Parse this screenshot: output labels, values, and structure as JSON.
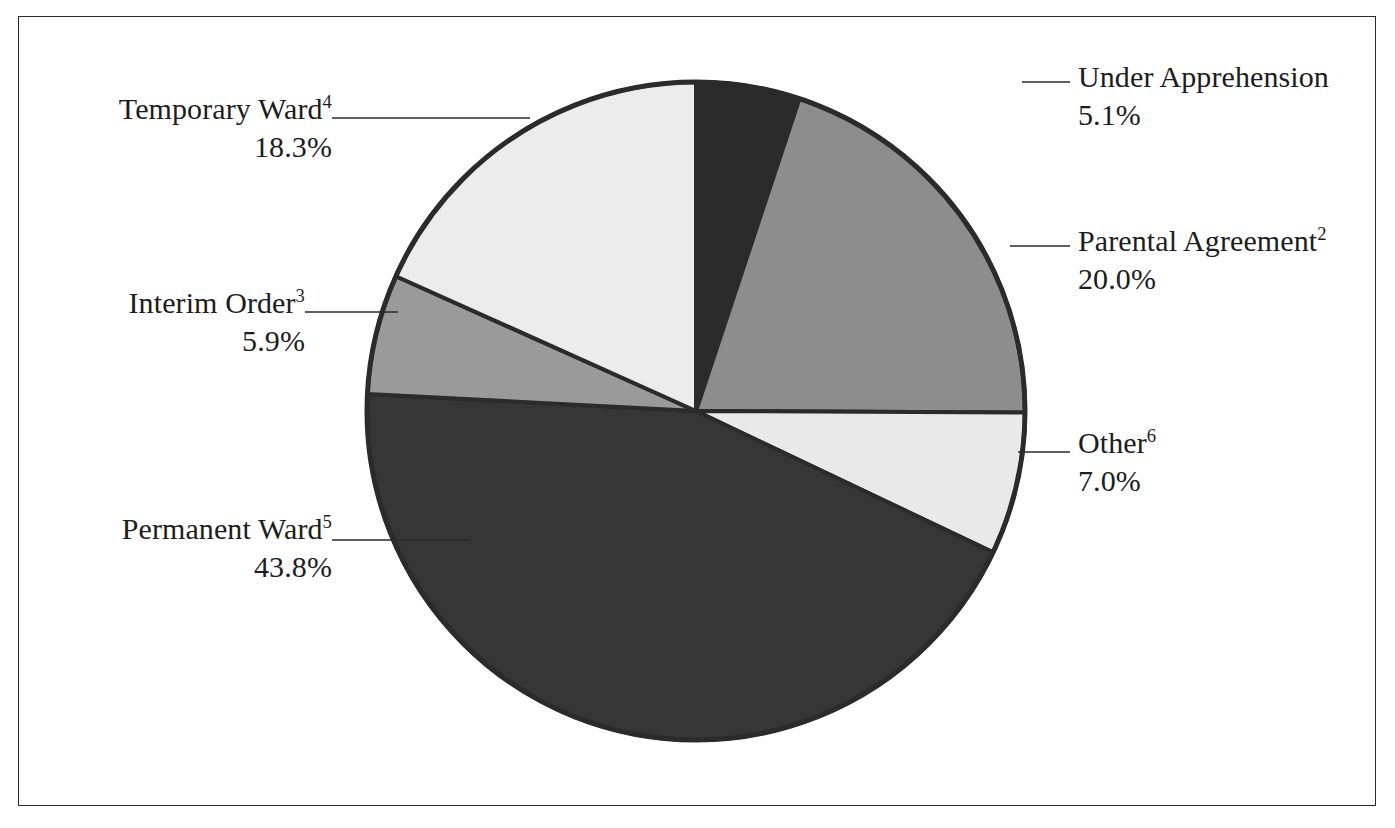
{
  "chart_data": {
    "type": "pie",
    "title": "",
    "subtitle": "",
    "xlabel": "",
    "ylabel": "",
    "legend_position": "callout-labels",
    "grid": false,
    "start_angle_deg": 0,
    "direction": "clockwise",
    "units": "percent",
    "categories": [
      "Under Apprehension",
      "Parental Agreement",
      "Other",
      "Permanent Ward",
      "Interim Order",
      "Temporary Ward"
    ],
    "values": [
      5.1,
      20.0,
      7.0,
      43.8,
      5.9,
      18.3
    ],
    "slices": [
      {
        "key": "under-apprehension",
        "name": "Under Apprehension",
        "footnote": "",
        "percent": 5.1,
        "percent_label": "5.1%",
        "color": "#2b2b2b",
        "label_side": "right"
      },
      {
        "key": "parental-agreement",
        "name": "Parental Agreement",
        "footnote": "2",
        "percent": 20.0,
        "percent_label": "20.0%",
        "color": "#8d8d8d",
        "label_side": "right"
      },
      {
        "key": "other",
        "name": "Other",
        "footnote": "6",
        "percent": 7.0,
        "percent_label": "7.0%",
        "color": "#e9e9e9",
        "label_side": "right"
      },
      {
        "key": "permanent-ward",
        "name": "Permanent Ward",
        "footnote": "5",
        "percent": 43.8,
        "percent_label": "43.8%",
        "color": "#363636",
        "label_side": "left"
      },
      {
        "key": "interim-order",
        "name": "Interim Order",
        "footnote": "3",
        "percent": 5.9,
        "percent_label": "5.9%",
        "color": "#9a9a9a",
        "label_side": "left"
      },
      {
        "key": "temporary-ward",
        "name": "Temporary Ward",
        "footnote": "4",
        "percent": 18.3,
        "percent_label": "18.3%",
        "color": "#ececec",
        "label_side": "left"
      }
    ]
  },
  "figure": {
    "background_color": "#ffffff",
    "border_color": "#2b2b2b",
    "outline_color": "#2b2b2b"
  },
  "labels": {
    "under_apprehension": {
      "name": "Under Apprehension",
      "footnote": "",
      "percent": "5.1%"
    },
    "parental_agreement": {
      "name": "Parental Agreement",
      "footnote": "2",
      "percent": "20.0%"
    },
    "other": {
      "name": "Other",
      "footnote": "6",
      "percent": "7.0%"
    },
    "temporary_ward": {
      "name": "Temporary Ward",
      "footnote": "4",
      "percent": "18.3%"
    },
    "interim_order": {
      "name": "Interim Order",
      "footnote": "3",
      "percent": "5.9%"
    },
    "permanent_ward": {
      "name": "Permanent Ward",
      "footnote": "5",
      "percent": "43.8%"
    }
  }
}
